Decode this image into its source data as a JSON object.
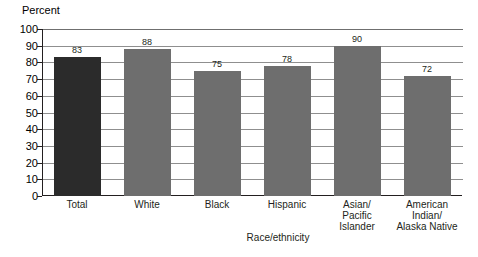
{
  "chart_data": {
    "type": "bar",
    "title": "",
    "xlabel": "Race/ethnicity",
    "ylabel": "Percent",
    "ylim": [
      0,
      100
    ],
    "ytick_step": 10,
    "yticks": [
      "100",
      "90",
      "80",
      "70",
      "60",
      "50",
      "40",
      "30",
      "20",
      "10",
      "0"
    ],
    "grid": "horizontal",
    "legend": "none",
    "categories": [
      "Total",
      "White",
      "Black",
      "Hispanic",
      "Asian/\nPacific\nIslander",
      "American\nIndian/\nAlaska Native"
    ],
    "values": [
      83,
      88,
      75,
      78,
      90,
      72
    ],
    "value_labels": [
      "83",
      "88",
      "75",
      "78",
      "90",
      "72"
    ],
    "bar_colors": [
      "#2b2b2b",
      "#6e6e6e",
      "#6e6e6e",
      "#6e6e6e",
      "#6e6e6e",
      "#6e6e6e"
    ],
    "colors": {
      "total_bar": "#2b2b2b",
      "group_bar": "#6e6e6e",
      "gridline": "#8f8f8f",
      "axis": "#231f20",
      "background": "#ffffff",
      "text": "#231f20"
    }
  }
}
